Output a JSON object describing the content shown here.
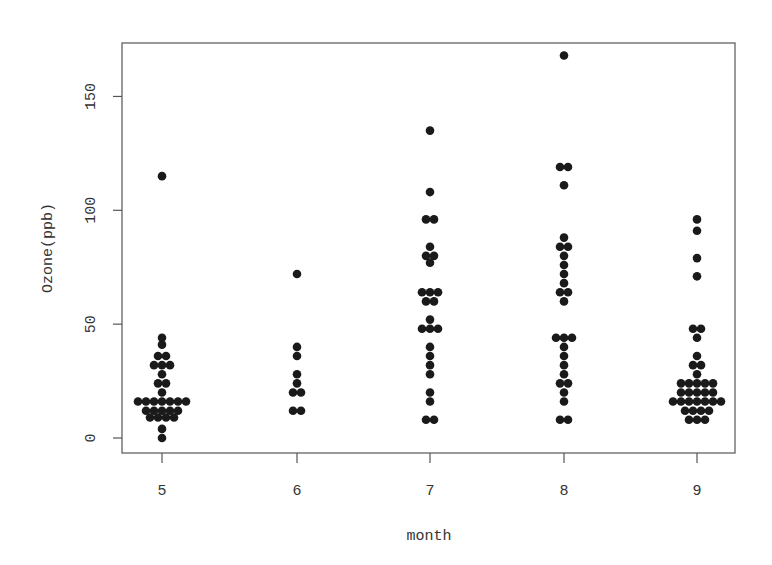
{
  "chart_data": {
    "type": "scatter",
    "subtype": "beeswarm",
    "title": "",
    "xlabel": "month",
    "ylabel": "Ozone(ppb)",
    "categories": [
      "5",
      "6",
      "7",
      "8",
      "9"
    ],
    "yticks": [
      0,
      50,
      100,
      150
    ],
    "ylim": [
      -7,
      172
    ],
    "grid": false,
    "legend": null,
    "marker_color": "#1a1a1a",
    "series": [
      {
        "name": "5",
        "points": [
          {
            "y": 115,
            "n": 1
          },
          {
            "y": 44,
            "n": 1
          },
          {
            "y": 41,
            "n": 1
          },
          {
            "y": 36,
            "n": 2
          },
          {
            "y": 32,
            "n": 3
          },
          {
            "y": 28,
            "n": 1
          },
          {
            "y": 24,
            "n": 2
          },
          {
            "y": 20,
            "n": 1
          },
          {
            "y": 16,
            "n": 7
          },
          {
            "y": 12,
            "n": 5
          },
          {
            "y": 9,
            "n": 4
          },
          {
            "y": 4,
            "n": 1
          },
          {
            "y": 0,
            "n": 1
          }
        ]
      },
      {
        "name": "6",
        "points": [
          {
            "y": 72,
            "n": 1
          },
          {
            "y": 40,
            "n": 1
          },
          {
            "y": 36,
            "n": 1
          },
          {
            "y": 28,
            "n": 1
          },
          {
            "y": 24,
            "n": 1
          },
          {
            "y": 20,
            "n": 2
          },
          {
            "y": 12,
            "n": 2
          }
        ]
      },
      {
        "name": "7",
        "points": [
          {
            "y": 135,
            "n": 1
          },
          {
            "y": 108,
            "n": 1
          },
          {
            "y": 96,
            "n": 2
          },
          {
            "y": 84,
            "n": 1
          },
          {
            "y": 80,
            "n": 2
          },
          {
            "y": 77,
            "n": 1
          },
          {
            "y": 64,
            "n": 3
          },
          {
            "y": 60,
            "n": 2
          },
          {
            "y": 52,
            "n": 1
          },
          {
            "y": 48,
            "n": 3
          },
          {
            "y": 40,
            "n": 1
          },
          {
            "y": 36,
            "n": 1
          },
          {
            "y": 32,
            "n": 1
          },
          {
            "y": 28,
            "n": 1
          },
          {
            "y": 20,
            "n": 1
          },
          {
            "y": 16,
            "n": 1
          },
          {
            "y": 8,
            "n": 2
          }
        ]
      },
      {
        "name": "8",
        "points": [
          {
            "y": 168,
            "n": 1
          },
          {
            "y": 119,
            "n": 2
          },
          {
            "y": 111,
            "n": 1
          },
          {
            "y": 88,
            "n": 1
          },
          {
            "y": 84,
            "n": 2
          },
          {
            "y": 80,
            "n": 1
          },
          {
            "y": 76,
            "n": 1
          },
          {
            "y": 72,
            "n": 1
          },
          {
            "y": 68,
            "n": 1
          },
          {
            "y": 64,
            "n": 2
          },
          {
            "y": 60,
            "n": 1
          },
          {
            "y": 44,
            "n": 3
          },
          {
            "y": 40,
            "n": 1
          },
          {
            "y": 36,
            "n": 1
          },
          {
            "y": 32,
            "n": 1
          },
          {
            "y": 28,
            "n": 1
          },
          {
            "y": 24,
            "n": 2
          },
          {
            "y": 20,
            "n": 1
          },
          {
            "y": 16,
            "n": 1
          },
          {
            "y": 8,
            "n": 2
          }
        ]
      },
      {
        "name": "9",
        "points": [
          {
            "y": 96,
            "n": 1
          },
          {
            "y": 91,
            "n": 1
          },
          {
            "y": 79,
            "n": 1
          },
          {
            "y": 71,
            "n": 1
          },
          {
            "y": 48,
            "n": 2
          },
          {
            "y": 44,
            "n": 1
          },
          {
            "y": 36,
            "n": 1
          },
          {
            "y": 32,
            "n": 2
          },
          {
            "y": 28,
            "n": 1
          },
          {
            "y": 24,
            "n": 5
          },
          {
            "y": 20,
            "n": 5
          },
          {
            "y": 16,
            "n": 7
          },
          {
            "y": 12,
            "n": 4
          },
          {
            "y": 8,
            "n": 3
          }
        ]
      }
    ]
  },
  "layout": {
    "plot_left": 122,
    "plot_right": 735,
    "plot_top": 43,
    "plot_bottom": 453,
    "y0_px": 438,
    "px_per_unit": 2.277,
    "x_positions": [
      162,
      297,
      430,
      564,
      697
    ],
    "dot_radius": 4.3,
    "dot_spacing": 8
  }
}
